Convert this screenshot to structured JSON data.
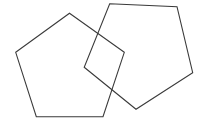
{
  "canvas": {
    "width": 203,
    "height": 131,
    "background": "#ffffff"
  },
  "shapes": [
    {
      "name": "left-pentagon",
      "type": "pentagon",
      "stroke": "#3a3a3a",
      "fill": "none",
      "points": "69.5,13.3 124.3,52.3 103,116.7 36.3,116.7 15.7,52.3"
    },
    {
      "name": "right-pentagon",
      "type": "pentagon",
      "stroke": "#3a3a3a",
      "fill": "none",
      "points": "109.7,3.7 177,6.7 192.7,72.7 136,109.3 84.2,67.3"
    }
  ]
}
